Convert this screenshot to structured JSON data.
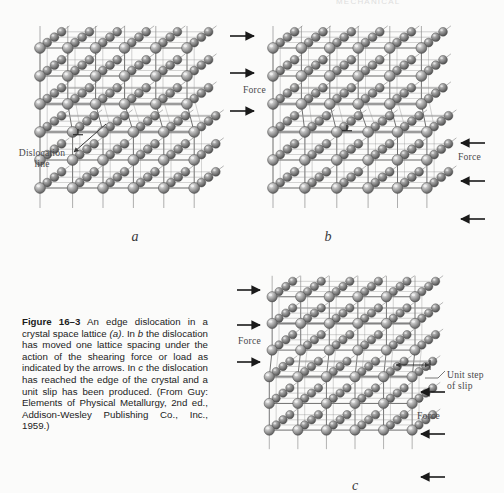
{
  "page": {
    "background": "#fbfbfa",
    "running_head": "MECHANICAL",
    "width": 504,
    "height": 493
  },
  "figure": {
    "number": "Figure 16–3",
    "caption_segments": [
      {
        "text": "Figure 16–3",
        "style": "bold"
      },
      {
        "text": "  An edge dislocation in a crystal space lattice ",
        "style": "normal"
      },
      {
        "text": "(a)",
        "style": "italic"
      },
      {
        "text": ". In ",
        "style": "normal"
      },
      {
        "text": "b",
        "style": "italic"
      },
      {
        "text": " the dislocation has moved one lattice spacing under the action of the shearing force or load as indicated by the arrows. In ",
        "style": "normal"
      },
      {
        "text": "c",
        "style": "italic"
      },
      {
        "text": " the dislocation has reached the edge of the crystal and a unit slip has been produced. (From Guy: Elements of Physical Metallurgy, 2nd ed., Addison-Wesley Publishing Co., Inc., 1959.)",
        "style": "normal"
      }
    ],
    "caption_plain": "Figure 16–3  An edge dislocation in a crystal space lattice (a). In b the dislocation has moved one lattice spacing under the action of the shearing force or load as indicated by the arrows. In c the dislocation has reached the edge of the crystal and a unit slip has been produced. (From Guy: Elements of Physical Metallurgy, 2nd ed., Addison-Wesley Publishing Co., Inc., 1959.)"
  },
  "panels": [
    {
      "id": "a",
      "letter": "a",
      "title": "edge dislocation in crystal space lattice",
      "annotations": [
        {
          "name": "dislocation-line-label",
          "text": "Dislocation\nline"
        },
        {
          "name": "dislocation-symbol",
          "text": "⊥"
        }
      ],
      "force_arrows": []
    },
    {
      "id": "b",
      "letter": "b",
      "title": "dislocation moved one lattice spacing",
      "annotations": [
        {
          "name": "force-label-left",
          "text": "Force"
        },
        {
          "name": "force-label-right",
          "text": "Force"
        },
        {
          "name": "dislocation-symbol",
          "text": "⊥"
        }
      ],
      "force_arrows": [
        {
          "side": "left",
          "direction": "right",
          "count": 3
        },
        {
          "side": "right",
          "direction": "left",
          "count": 3
        }
      ]
    },
    {
      "id": "c",
      "letter": "c",
      "title": "dislocation reached edge, unit slip produced",
      "annotations": [
        {
          "name": "force-label-left",
          "text": "Force"
        },
        {
          "name": "force-label-right",
          "text": "Force"
        },
        {
          "name": "unit-step-of-slip-label",
          "text": "Unit step\nof slip"
        }
      ],
      "force_arrows": [
        {
          "side": "left",
          "direction": "right",
          "count": 3
        },
        {
          "side": "right",
          "direction": "left",
          "count": 3
        }
      ]
    }
  ],
  "colors": {
    "atom_light": "#c9c9c9",
    "atom_mid": "#9a9a9a",
    "atom_dark": "#6b6b6b",
    "atom_outline": "#4d4d4d",
    "bond_line": "#8d8d8d",
    "bond_line_dark": "#5f5f5f",
    "text": "#4a494b",
    "caption_text": "#1c1c1c",
    "arrow": "#1a1a1a",
    "background": "#fbfbfa"
  },
  "lattice": {
    "columns": 6,
    "rows": 6,
    "depth_atoms": 4,
    "description": "cubic space lattice drawn in oblique projection; each front atom trails a row of atoms receding up-right"
  }
}
